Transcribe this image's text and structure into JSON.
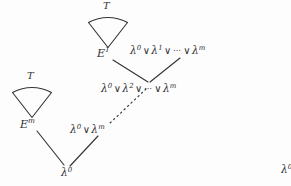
{
  "figure": {
    "type": "proof-tree-diagram",
    "background_color": "#fdfdfd",
    "ink_color": "#303030",
    "width": 291,
    "height": 186
  },
  "derivations": [
    {
      "id": "top",
      "tree_label": "T",
      "root_label": "E",
      "root_superscript": "1",
      "root_text": "E¹"
    },
    {
      "id": "bottom-left",
      "tree_label": "T",
      "root_label": "E",
      "root_superscript": "m",
      "root_text": "Eᵐ"
    }
  ],
  "clauses": {
    "top_right": {
      "text": "λ⁰ ∨ λ¹ ∨ ⋯ ∨ λᵐ",
      "parts": [
        "λ",
        "0",
        "∨",
        "λ",
        "1",
        "∨",
        "⋯",
        "∨",
        "λ",
        "m"
      ]
    },
    "middle": {
      "text": "λ⁰ ∨ λ² ∨ ⋯ ∨ λᵐ",
      "parts": [
        "λ",
        "0",
        "∨",
        "λ",
        "2",
        "∨",
        "⋯",
        "∨",
        "λ",
        "m"
      ]
    },
    "lower": {
      "text": "λ⁰ ∨ λᵐ",
      "parts": [
        "λ",
        "0",
        "∨",
        "λ",
        "m"
      ]
    },
    "bottom": {
      "text": "λ⁰",
      "parts": [
        "λ",
        "0"
      ]
    },
    "right_clipped": {
      "text": "λ⁰",
      "parts": [
        "λ",
        "0"
      ]
    }
  },
  "labels": {
    "lambda": "λ",
    "vee": "∨",
    "ellipsis": "⋯",
    "tree": "T",
    "sup_zero": "0",
    "sup_one": "1",
    "sup_two": "2",
    "sup_m": "m",
    "e": "E"
  },
  "edges": [
    {
      "name": "e1-to-middle",
      "style": "solid",
      "from": "E¹",
      "to": "middle-vertex"
    },
    {
      "name": "topright-to-middle",
      "style": "solid",
      "from": "λ⁰ ∨ λ¹ ∨ ⋯ ∨ λᵐ",
      "to": "middle-vertex"
    },
    {
      "name": "middle-to-lower",
      "style": "dotted",
      "from": "middle-vertex",
      "to": "λ⁰ ∨ λᵐ"
    },
    {
      "name": "em-to-bottom",
      "style": "solid",
      "from": "Eᵐ",
      "to": "λ⁰"
    },
    {
      "name": "lower-to-bottom",
      "style": "solid",
      "from": "λ⁰ ∨ λᵐ",
      "to": "λ⁰"
    }
  ]
}
